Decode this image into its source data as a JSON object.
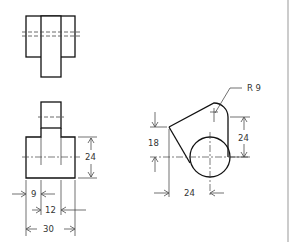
{
  "drawing": {
    "type": "orthographic-projection",
    "views": [
      "top-view",
      "front-view",
      "side-view"
    ],
    "colors": {
      "line": "#111111",
      "dimension": "#333333",
      "background": "#ffffff"
    },
    "dimensions": {
      "front_height": "24",
      "front_left_offset": "9",
      "front_center_width": "12",
      "front_total_width": "30",
      "side_radius": "R 9",
      "side_vertical": "24",
      "side_left_height": "18",
      "side_horizontal": "24"
    }
  }
}
